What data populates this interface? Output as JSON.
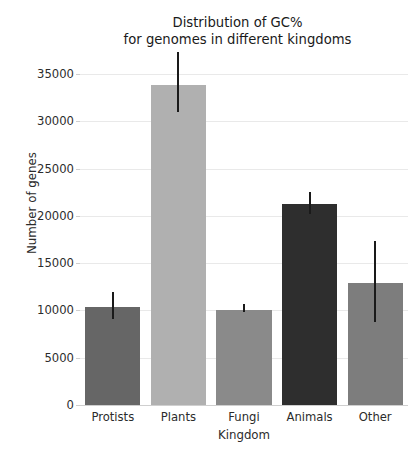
{
  "chart_data": {
    "type": "bar",
    "title_line1": "Distribution of GC%",
    "title_line2": "for genomes in different kingdoms",
    "xlabel": "Kingdom",
    "ylabel": "Number of genes",
    "categories": [
      "Protists",
      "Plants",
      "Fungi",
      "Animals",
      "Other"
    ],
    "values": [
      10400,
      33900,
      10050,
      21300,
      12900
    ],
    "error_low": [
      9100,
      31000,
      9800,
      20200,
      8800
    ],
    "error_high": [
      12000,
      37300,
      10700,
      22500,
      17300
    ],
    "bar_colors": [
      "#666666",
      "#b0b0b0",
      "#8a8a8a",
      "#2e2e2e",
      "#7d7d7d"
    ],
    "errorbar_color": "#1a1a1a",
    "ylim": [
      0,
      36500
    ],
    "xlim": [
      0,
      5
    ],
    "yticks": [
      0,
      5000,
      10000,
      15000,
      20000,
      25000,
      30000,
      35000
    ],
    "ytick_labels": [
      "0",
      "5000",
      "10000",
      "15000",
      "20000",
      "25000",
      "30000",
      "35000"
    ],
    "grid": "horizontal",
    "grid_color": "#e9e9e9",
    "legend": "none",
    "background": "#ffffff"
  }
}
